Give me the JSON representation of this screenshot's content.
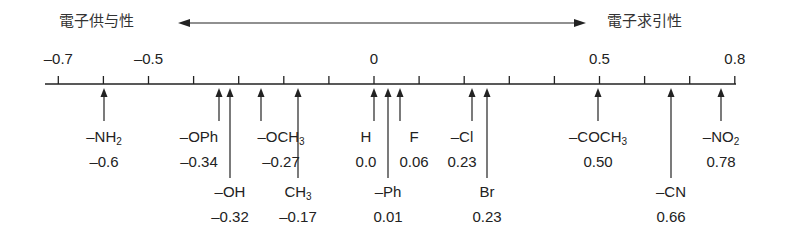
{
  "header": {
    "left_label": "電子供与性",
    "right_label": "電子求引性",
    "arrow": "double-headed-arrow"
  },
  "axis": {
    "min": -0.7,
    "max": 0.8,
    "tick_step": 0.1,
    "tick_labels": [
      {
        "value": -0.7,
        "text": "–0.7"
      },
      {
        "value": -0.5,
        "text": "–0.5"
      },
      {
        "value": 0,
        "text": "0"
      },
      {
        "value": 0.5,
        "text": "0.5"
      },
      {
        "value": 0.8,
        "text": "0.8"
      }
    ]
  },
  "substituents": [
    {
      "name": "–NH",
      "sub": "2",
      "value_text": "–0.6",
      "value": -0.6,
      "row": 1
    },
    {
      "name": "–OPh",
      "sub": "",
      "value_text": "–0.34",
      "value": -0.34,
      "row": 1
    },
    {
      "name": "–OH",
      "sub": "",
      "value_text": "–0.32",
      "value": -0.32,
      "row": 2
    },
    {
      "name": "–OCH",
      "sub": "3",
      "value_text": "–0.27",
      "value": -0.27,
      "row": 1
    },
    {
      "name": "CH",
      "sub": "3",
      "value_text": "–0.17",
      "value": -0.17,
      "row": 2
    },
    {
      "name": "H",
      "sub": "",
      "value_text": "0.0",
      "value": 0.0,
      "row": 1
    },
    {
      "name": "–Ph",
      "sub": "",
      "value_text": "0.01",
      "value": 0.01,
      "row": 2
    },
    {
      "name": "F",
      "sub": "",
      "value_text": "0.06",
      "value": 0.06,
      "row": 1
    },
    {
      "name": "–Cl",
      "sub": "",
      "value_text": "0.23",
      "value": 0.23,
      "row": 1
    },
    {
      "name": "Br",
      "sub": "",
      "value_text": "0.23",
      "value": 0.23,
      "row": 2
    },
    {
      "name": "–COCH",
      "sub": "3",
      "value_text": "0.50",
      "value": 0.5,
      "row": 1
    },
    {
      "name": "–CN",
      "sub": "",
      "value_text": "0.66",
      "value": 0.66,
      "row": 2
    },
    {
      "name": "–NO",
      "sub": "2",
      "value_text": "0.78",
      "value": 0.78,
      "row": 1
    }
  ]
}
